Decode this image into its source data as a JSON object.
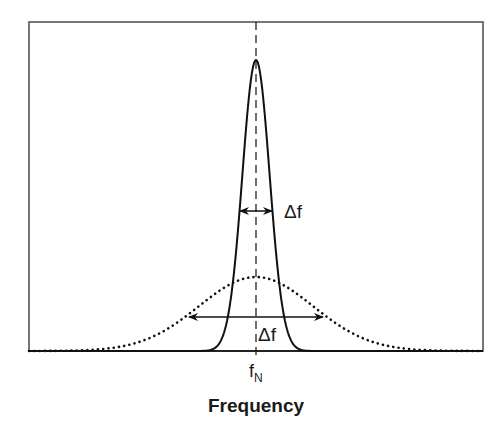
{
  "figure": {
    "frame": {
      "x": 29,
      "y": 22,
      "width": 454,
      "height": 329,
      "stroke": "#555555"
    },
    "center_line": {
      "x": 256,
      "style": "dashed",
      "stroke": "#222222"
    },
    "axis": {
      "title": "Frequency",
      "center_tick_label_main": "f",
      "center_tick_label_sub": "N"
    },
    "narrow_curve": {
      "label": "Δf",
      "style": "solid",
      "stroke": "#111111",
      "peak_y": 60,
      "sigma_px": 13.6
    },
    "wide_curve": {
      "label": "Δf",
      "style": "dotted",
      "stroke": "#111111",
      "peak_y": 277,
      "sigma_px": 57
    },
    "narrow_arrow": {
      "x1": 240,
      "x2": 272,
      "y": 211
    },
    "wide_arrow": {
      "x1": 189,
      "x2": 323,
      "y": 317
    }
  },
  "chart_data": {
    "type": "line",
    "title": "",
    "xlabel": "Frequency",
    "ylabel": "",
    "x_tick_labels": [
      "f_N"
    ],
    "grid": false,
    "legend": null,
    "series": [
      {
        "name": "narrow line (solid)",
        "shape": "gaussian",
        "center": "f_N",
        "relative_peak_height": 1.0,
        "width_annotation": "Δf (narrow)"
      },
      {
        "name": "broad line (dotted)",
        "shape": "gaussian",
        "center": "f_N",
        "relative_peak_height": 0.25,
        "width_annotation": "Δf (broad)"
      }
    ],
    "annotations": [
      {
        "text": "Δf",
        "target": "narrow line FWHM arrow"
      },
      {
        "text": "Δf",
        "target": "broad line FWHM arrow"
      },
      {
        "text": "f_N",
        "target": "center frequency (dashed line)"
      }
    ]
  }
}
